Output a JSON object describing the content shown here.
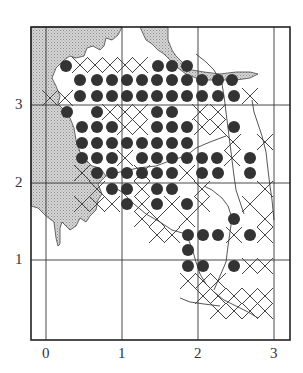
{
  "figure": {
    "type": "distribution-map",
    "colors": {
      "land_shade": "#c4c4c4",
      "dot": "#333333",
      "line": "#444444",
      "background": "#ffffff"
    },
    "frame": {
      "left": 31,
      "top": 27,
      "right": 290,
      "bottom": 340
    },
    "x_ticks": [
      {
        "label": "0",
        "px": 46
      },
      {
        "label": "1",
        "px": 122
      },
      {
        "label": "2",
        "px": 198
      },
      {
        "label": "3",
        "px": 274
      }
    ],
    "y_ticks": [
      {
        "label": "3",
        "py": 105
      },
      {
        "label": "2",
        "py": 183
      },
      {
        "label": "1",
        "py": 260
      }
    ],
    "legend": {
      "dot": "filled-circle marker (record present)",
      "cross": "x-cross marker (other record)"
    },
    "dots": [
      [
        66,
        66
      ],
      [
        80,
        80
      ],
      [
        97,
        80
      ],
      [
        112,
        80
      ],
      [
        127,
        80
      ],
      [
        142,
        80
      ],
      [
        157,
        80
      ],
      [
        172,
        80
      ],
      [
        187,
        80
      ],
      [
        202,
        80
      ],
      [
        218,
        80
      ],
      [
        232,
        80
      ],
      [
        158,
        66
      ],
      [
        172,
        66
      ],
      [
        187,
        66
      ],
      [
        80,
        96
      ],
      [
        97,
        96
      ],
      [
        112,
        96
      ],
      [
        127,
        96
      ],
      [
        142,
        96
      ],
      [
        157,
        96
      ],
      [
        172,
        96
      ],
      [
        187,
        96
      ],
      [
        202,
        96
      ],
      [
        218,
        96
      ],
      [
        234,
        96
      ],
      [
        67,
        112
      ],
      [
        97,
        112
      ],
      [
        157,
        112
      ],
      [
        172,
        112
      ],
      [
        82,
        127
      ],
      [
        97,
        127
      ],
      [
        112,
        127
      ],
      [
        157,
        127
      ],
      [
        172,
        127
      ],
      [
        187,
        127
      ],
      [
        234,
        127
      ],
      [
        82,
        143
      ],
      [
        97,
        143
      ],
      [
        112,
        143
      ],
      [
        127,
        143
      ],
      [
        142,
        143
      ],
      [
        157,
        143
      ],
      [
        172,
        143
      ],
      [
        187,
        143
      ],
      [
        82,
        158
      ],
      [
        97,
        158
      ],
      [
        112,
        158
      ],
      [
        142,
        158
      ],
      [
        157,
        158
      ],
      [
        172,
        158
      ],
      [
        187,
        158
      ],
      [
        202,
        158
      ],
      [
        217,
        158
      ],
      [
        250,
        158
      ],
      [
        97,
        173
      ],
      [
        112,
        173
      ],
      [
        127,
        173
      ],
      [
        142,
        173
      ],
      [
        157,
        173
      ],
      [
        172,
        173
      ],
      [
        202,
        173
      ],
      [
        218,
        173
      ],
      [
        250,
        173
      ],
      [
        112,
        189
      ],
      [
        127,
        189
      ],
      [
        157,
        189
      ],
      [
        172,
        189
      ],
      [
        127,
        204
      ],
      [
        157,
        204
      ],
      [
        187,
        204
      ],
      [
        234,
        219
      ],
      [
        188,
        235
      ],
      [
        203,
        235
      ],
      [
        218,
        235
      ],
      [
        250,
        235
      ],
      [
        188,
        250
      ],
      [
        188,
        266
      ],
      [
        203,
        266
      ],
      [
        234,
        266
      ]
    ],
    "crosses": [
      [
        80,
        65
      ],
      [
        95,
        65
      ],
      [
        110,
        65
      ],
      [
        125,
        65
      ],
      [
        140,
        65
      ],
      [
        50,
        98
      ],
      [
        65,
        98
      ],
      [
        110,
        112
      ],
      [
        125,
        112
      ],
      [
        140,
        112
      ],
      [
        200,
        112
      ],
      [
        218,
        112
      ],
      [
        250,
        96
      ],
      [
        125,
        127
      ],
      [
        140,
        127
      ],
      [
        202,
        127
      ],
      [
        218,
        127
      ],
      [
        233,
        142
      ],
      [
        265,
        142
      ],
      [
        125,
        158
      ],
      [
        232,
        158
      ],
      [
        82,
        173
      ],
      [
        142,
        173
      ],
      [
        187,
        173
      ],
      [
        97,
        189
      ],
      [
        142,
        189
      ],
      [
        202,
        189
      ],
      [
        265,
        189
      ],
      [
        82,
        204
      ],
      [
        97,
        204
      ],
      [
        112,
        204
      ],
      [
        142,
        204
      ],
      [
        172,
        204
      ],
      [
        202,
        204
      ],
      [
        142,
        219
      ],
      [
        157,
        219
      ],
      [
        187,
        219
      ],
      [
        265,
        219
      ],
      [
        250,
        204
      ],
      [
        157,
        235
      ],
      [
        172,
        235
      ],
      [
        234,
        235
      ],
      [
        265,
        235
      ],
      [
        188,
        281
      ],
      [
        203,
        281
      ],
      [
        218,
        281
      ],
      [
        250,
        266
      ],
      [
        265,
        266
      ],
      [
        203,
        296
      ],
      [
        218,
        296
      ],
      [
        234,
        296
      ],
      [
        250,
        296
      ],
      [
        265,
        296
      ],
      [
        218,
        311
      ],
      [
        234,
        311
      ],
      [
        250,
        311
      ],
      [
        265,
        311
      ]
    ]
  }
}
